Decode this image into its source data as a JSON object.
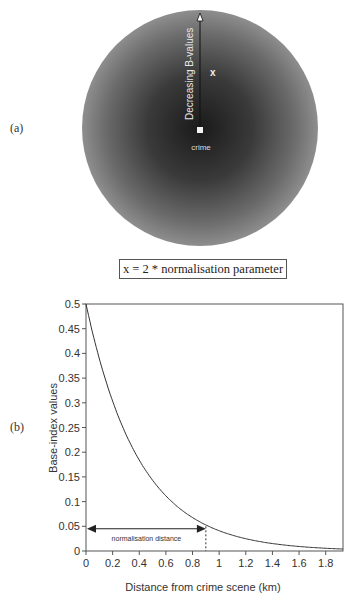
{
  "panels": {
    "a": {
      "label": "(a)",
      "arrow_label": "Decreasing B-values",
      "center_label": "crime",
      "point_label": "x",
      "caption": "x = 2 * normalisation parameter"
    },
    "b": {
      "label": "(b)"
    }
  },
  "chart_data": [
    {
      "type": "diagram",
      "title": "",
      "description": "Radial gradient disc centred on crime location; darker at centre, lighter toward edge",
      "annotations": [
        "Decreasing B-values",
        "crime",
        "x",
        "x = 2 * normalisation parameter"
      ]
    },
    {
      "type": "line",
      "title": "",
      "xlabel": "Distance from crime scene (km)",
      "ylabel": "Base-index values",
      "xlim": [
        0,
        1.93
      ],
      "ylim": [
        0,
        0.5
      ],
      "x_ticks": [
        "0",
        "0.2",
        "0.4",
        "0.6",
        "0.8",
        "1",
        "1.2",
        "1.4",
        "1.6",
        "1.8"
      ],
      "y_ticks": [
        "0",
        "0.05",
        "0.1",
        "0.15",
        "0.2",
        "0.25",
        "0.3",
        "0.35",
        "0.4",
        "0.45",
        "0.5"
      ],
      "grid": false,
      "legend": null,
      "series": [
        {
          "name": "Base-index values",
          "x": [
            0,
            0.1,
            0.2,
            0.3,
            0.4,
            0.5,
            0.6,
            0.7,
            0.8,
            0.9,
            1.0,
            1.1,
            1.2,
            1.3,
            1.4,
            1.5,
            1.6,
            1.7,
            1.8,
            1.9
          ],
          "values": [
            0.5,
            0.39,
            0.3,
            0.24,
            0.18,
            0.14,
            0.11,
            0.087,
            0.068,
            0.053,
            0.041,
            0.032,
            0.025,
            0.019,
            0.015,
            0.012,
            0.009,
            0.007,
            0.006,
            0.004
          ]
        }
      ],
      "annotations": [
        {
          "text": "normalisation distance",
          "type": "double-arrow",
          "x_from": 0,
          "x_to": 0.9,
          "y": 0.045
        },
        {
          "text": "",
          "type": "dashed-vline",
          "x": 0.9,
          "y_from": 0,
          "y_to": 0.05
        }
      ]
    }
  ]
}
